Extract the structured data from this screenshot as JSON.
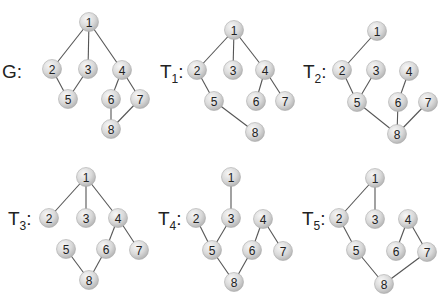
{
  "colors": {
    "edge": "#555555",
    "node_fill_light": "#f4f4f4",
    "node_fill_dark": "#bdbdbd",
    "node_stroke": "#aaaaaa",
    "text": "#222222"
  },
  "graphs": [
    {
      "id": "G",
      "label": "G",
      "subscript": "",
      "label_pos": [
        2,
        78
      ],
      "nodes": [
        {
          "id": "1",
          "x": 89,
          "y": 22
        },
        {
          "id": "2",
          "x": 52,
          "y": 69
        },
        {
          "id": "3",
          "x": 88,
          "y": 69
        },
        {
          "id": "4",
          "x": 122,
          "y": 70
        },
        {
          "id": "5",
          "x": 68,
          "y": 99
        },
        {
          "id": "6",
          "x": 111,
          "y": 99
        },
        {
          "id": "7",
          "x": 140,
          "y": 99
        },
        {
          "id": "8",
          "x": 111,
          "y": 129
        }
      ],
      "edges": [
        [
          "1",
          "2"
        ],
        [
          "1",
          "3"
        ],
        [
          "1",
          "4"
        ],
        [
          "2",
          "5"
        ],
        [
          "3",
          "5"
        ],
        [
          "4",
          "6"
        ],
        [
          "4",
          "7"
        ],
        [
          "6",
          "8"
        ],
        [
          "7",
          "8"
        ]
      ]
    },
    {
      "id": "T1",
      "label": "T",
      "subscript": "1",
      "label_pos": [
        160,
        78
      ],
      "nodes": [
        {
          "id": "1",
          "x": 234,
          "y": 30
        },
        {
          "id": "2",
          "x": 197,
          "y": 70
        },
        {
          "id": "3",
          "x": 233,
          "y": 70
        },
        {
          "id": "4",
          "x": 265,
          "y": 70
        },
        {
          "id": "5",
          "x": 214,
          "y": 101
        },
        {
          "id": "6",
          "x": 256,
          "y": 101
        },
        {
          "id": "7",
          "x": 285,
          "y": 101
        },
        {
          "id": "8",
          "x": 255,
          "y": 132
        }
      ],
      "edges": [
        [
          "1",
          "2"
        ],
        [
          "1",
          "3"
        ],
        [
          "1",
          "4"
        ],
        [
          "2",
          "5"
        ],
        [
          "4",
          "6"
        ],
        [
          "4",
          "7"
        ],
        [
          "5",
          "8"
        ]
      ]
    },
    {
      "id": "T2",
      "label": "T",
      "subscript": "2",
      "label_pos": [
        303,
        78
      ],
      "nodes": [
        {
          "id": "1",
          "x": 377,
          "y": 31
        },
        {
          "id": "2",
          "x": 342,
          "y": 70
        },
        {
          "id": "3",
          "x": 376,
          "y": 70
        },
        {
          "id": "4",
          "x": 409,
          "y": 71
        },
        {
          "id": "5",
          "x": 357,
          "y": 102
        },
        {
          "id": "6",
          "x": 398,
          "y": 102
        },
        {
          "id": "7",
          "x": 428,
          "y": 102
        },
        {
          "id": "8",
          "x": 397,
          "y": 134
        }
      ],
      "edges": [
        [
          "1",
          "2"
        ],
        [
          "2",
          "5"
        ],
        [
          "3",
          "5"
        ],
        [
          "4",
          "6"
        ],
        [
          "5",
          "8"
        ],
        [
          "6",
          "8"
        ],
        [
          "7",
          "8"
        ]
      ]
    },
    {
      "id": "T3",
      "label": "T",
      "subscript": "3",
      "label_pos": [
        8,
        225
      ],
      "nodes": [
        {
          "id": "1",
          "x": 86,
          "y": 177
        },
        {
          "id": "2",
          "x": 49,
          "y": 218
        },
        {
          "id": "3",
          "x": 86,
          "y": 218
        },
        {
          "id": "4",
          "x": 118,
          "y": 218
        },
        {
          "id": "5",
          "x": 66,
          "y": 249
        },
        {
          "id": "6",
          "x": 106,
          "y": 249
        },
        {
          "id": "7",
          "x": 139,
          "y": 250
        },
        {
          "id": "8",
          "x": 89,
          "y": 280
        }
      ],
      "edges": [
        [
          "1",
          "2"
        ],
        [
          "1",
          "3"
        ],
        [
          "1",
          "4"
        ],
        [
          "4",
          "6"
        ],
        [
          "4",
          "7"
        ],
        [
          "5",
          "8"
        ],
        [
          "6",
          "8"
        ]
      ]
    },
    {
      "id": "T4",
      "label": "T",
      "subscript": "4",
      "label_pos": [
        158,
        225
      ],
      "nodes": [
        {
          "id": "1",
          "x": 231,
          "y": 177
        },
        {
          "id": "2",
          "x": 196,
          "y": 218
        },
        {
          "id": "3",
          "x": 231,
          "y": 218
        },
        {
          "id": "4",
          "x": 263,
          "y": 219
        },
        {
          "id": "5",
          "x": 212,
          "y": 250
        },
        {
          "id": "6",
          "x": 252,
          "y": 250
        },
        {
          "id": "7",
          "x": 283,
          "y": 251
        },
        {
          "id": "8",
          "x": 234,
          "y": 282
        }
      ],
      "edges": [
        [
          "1",
          "3"
        ],
        [
          "2",
          "5"
        ],
        [
          "3",
          "5"
        ],
        [
          "4",
          "6"
        ],
        [
          "4",
          "7"
        ],
        [
          "5",
          "8"
        ],
        [
          "6",
          "8"
        ]
      ]
    },
    {
      "id": "T5",
      "label": "T",
      "subscript": "5",
      "label_pos": [
        302,
        225
      ],
      "nodes": [
        {
          "id": "1",
          "x": 375,
          "y": 178
        },
        {
          "id": "2",
          "x": 339,
          "y": 218
        },
        {
          "id": "3",
          "x": 375,
          "y": 219
        },
        {
          "id": "4",
          "x": 408,
          "y": 219
        },
        {
          "id": "5",
          "x": 356,
          "y": 250
        },
        {
          "id": "6",
          "x": 396,
          "y": 251
        },
        {
          "id": "7",
          "x": 427,
          "y": 252
        },
        {
          "id": "8",
          "x": 384,
          "y": 284
        }
      ],
      "edges": [
        [
          "1",
          "2"
        ],
        [
          "1",
          "3"
        ],
        [
          "2",
          "5"
        ],
        [
          "4",
          "6"
        ],
        [
          "4",
          "7"
        ],
        [
          "5",
          "8"
        ],
        [
          "7",
          "8"
        ]
      ]
    }
  ]
}
